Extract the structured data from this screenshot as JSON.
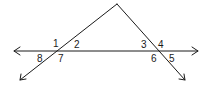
{
  "diagram": {
    "type": "parallel-like transversal angle diagram",
    "stroke_color": "#1a1a1a",
    "background": "#ffffff",
    "lines": [
      {
        "name": "horizontal-line",
        "from": [
          14,
          51
        ],
        "to": [
          198,
          51
        ],
        "arrows": "both"
      },
      {
        "name": "left-transversal",
        "from": [
          117,
          4
        ],
        "to": [
          20,
          80
        ],
        "arrows": "end"
      },
      {
        "name": "right-transversal",
        "from": [
          117,
          4
        ],
        "to": [
          185,
          80
        ],
        "arrows": "end"
      }
    ],
    "intersections": [
      {
        "name": "left-intersection",
        "point": [
          58,
          51
        ]
      },
      {
        "name": "right-intersection",
        "point": [
          157,
          51
        ]
      }
    ],
    "apex": [
      117,
      4
    ],
    "angle_labels": [
      {
        "id": "1",
        "text": "1",
        "x": 53,
        "y": 38
      },
      {
        "id": "2",
        "text": "2",
        "x": 74,
        "y": 40
      },
      {
        "id": "7",
        "text": "7",
        "x": 58,
        "y": 55
      },
      {
        "id": "8",
        "text": "8",
        "x": 37,
        "y": 55
      },
      {
        "id": "3",
        "text": "3",
        "x": 141,
        "y": 40
      },
      {
        "id": "4",
        "text": "4",
        "x": 158,
        "y": 40
      },
      {
        "id": "6",
        "text": "6",
        "x": 150,
        "y": 55
      },
      {
        "id": "5",
        "text": "5",
        "x": 169,
        "y": 55
      }
    ]
  }
}
